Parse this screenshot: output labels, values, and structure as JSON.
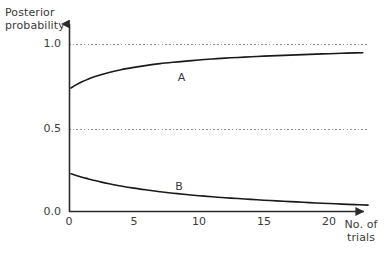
{
  "chart_data": {
    "type": "line",
    "title": "",
    "subtitle": "",
    "xlabel": "No. of\ntrials",
    "ylabel": "Posterior\nprobability",
    "xlim": [
      0,
      23
    ],
    "ylim": [
      0.0,
      1.12
    ],
    "grid": "dashed horizontal reference lines at y=1.0 and y=0.5",
    "legend_position": "inline curve labels",
    "x_ticks": [
      {
        "value": 0,
        "label": "0"
      },
      {
        "value": 5,
        "label": "5"
      },
      {
        "value": 10,
        "label": "10"
      },
      {
        "value": 15,
        "label": "15"
      },
      {
        "value": 20,
        "label": "20"
      }
    ],
    "y_ticks": [
      {
        "value": 0.0,
        "label": "0.0"
      },
      {
        "value": 0.5,
        "label": "0.5"
      },
      {
        "value": 1.0,
        "label": "1.0"
      }
    ],
    "reference_lines": [
      {
        "y": 1.0,
        "style": "dashed"
      },
      {
        "y": 0.5,
        "style": "dashed"
      }
    ],
    "series": [
      {
        "name": "A",
        "label": "A",
        "label_x": 8.6,
        "label_y": 0.805,
        "color": "#1a1a1a",
        "x": [
          0.15,
          0.5,
          1,
          1.5,
          2,
          2.5,
          3,
          4,
          5,
          6,
          7,
          8,
          9,
          10,
          11,
          12,
          13,
          14,
          15,
          16,
          17,
          18,
          19,
          20,
          21,
          22,
          22.6
        ],
        "values": [
          0.738,
          0.755,
          0.775,
          0.792,
          0.806,
          0.818,
          0.829,
          0.847,
          0.861,
          0.873,
          0.883,
          0.891,
          0.898,
          0.905,
          0.911,
          0.916,
          0.92,
          0.924,
          0.928,
          0.931,
          0.934,
          0.937,
          0.94,
          0.942,
          0.945,
          0.947,
          0.948
        ]
      },
      {
        "name": "B",
        "label": "B",
        "label_x": 8.4,
        "label_y": 0.152,
        "color": "#1a1a1a",
        "x": [
          0.15,
          0.5,
          1,
          1.5,
          2,
          2.5,
          3,
          4,
          5,
          6,
          7,
          8,
          9,
          10,
          11,
          12,
          13,
          14,
          15,
          16,
          17,
          18,
          19,
          20,
          21,
          22,
          23
        ],
        "values": [
          0.228,
          0.219,
          0.207,
          0.197,
          0.187,
          0.178,
          0.17,
          0.155,
          0.142,
          0.131,
          0.121,
          0.112,
          0.104,
          0.097,
          0.091,
          0.085,
          0.08,
          0.075,
          0.07,
          0.066,
          0.062,
          0.058,
          0.054,
          0.051,
          0.047,
          0.044,
          0.041
        ]
      }
    ],
    "colors": {
      "axis": "#2b2b2b",
      "curve": "#1a1a1a",
      "gridline": "#8c8c8c",
      "text": "#3a3a3a",
      "background": "#ffffff"
    }
  }
}
